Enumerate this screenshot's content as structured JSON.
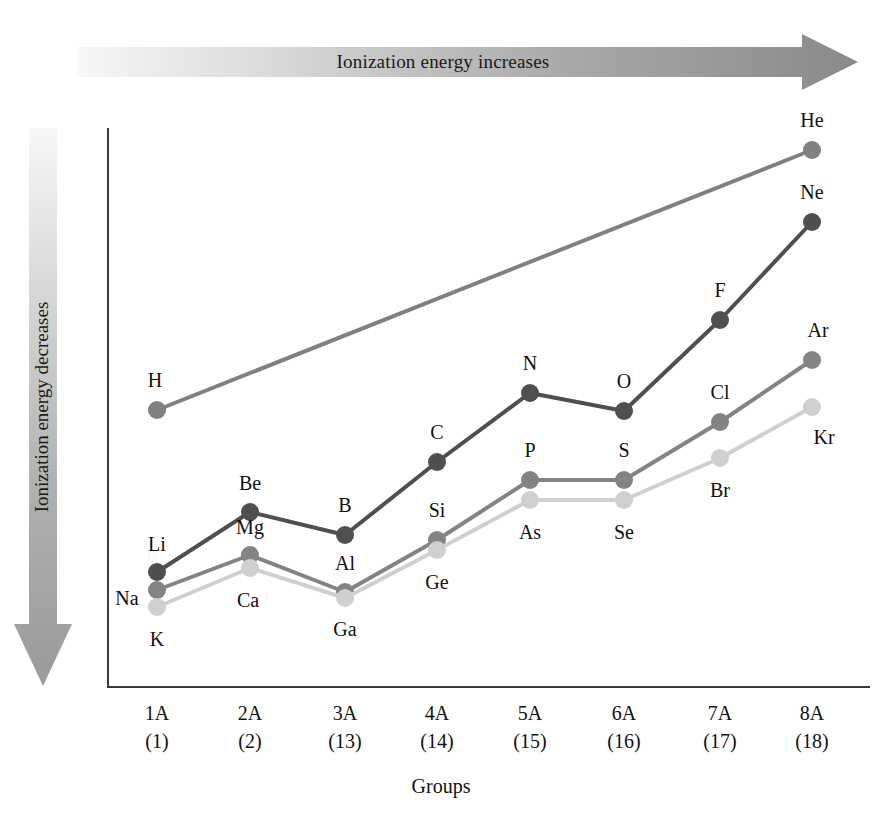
{
  "annotations": {
    "top_arrow": {
      "text": "Ionization energy increases",
      "direction": "right",
      "gradient_from": "#f2f2f2",
      "gradient_to": "#8d8d8d"
    },
    "left_arrow": {
      "text": "Ionization energy decreases",
      "direction": "down",
      "gradient_from": "#f2f2f2",
      "gradient_to": "#9a9a9a"
    }
  },
  "chart_data": {
    "type": "line",
    "title": "",
    "xlabel": "Groups",
    "ylabel": "",
    "grid": false,
    "legend": "none",
    "categories": [
      "1A",
      "2A",
      "3A",
      "4A",
      "5A",
      "6A",
      "7A",
      "8A"
    ],
    "category_numbers": [
      "(1)",
      "(2)",
      "(13)",
      "(14)",
      "(15)",
      "(16)",
      "(17)",
      "(18)"
    ],
    "x_ticks": [
      {
        "group": "1A",
        "number": "(1)"
      },
      {
        "group": "2A",
        "number": "(2)"
      },
      {
        "group": "3A",
        "number": "(13)"
      },
      {
        "group": "4A",
        "number": "(14)"
      },
      {
        "group": "5A",
        "number": "(15)"
      },
      {
        "group": "6A",
        "number": "(16)"
      },
      {
        "group": "7A",
        "number": "(17)"
      },
      {
        "group": "8A",
        "number": "(18)"
      }
    ],
    "series": [
      {
        "name": "Period 1",
        "color": "#808080",
        "points": [
          {
            "label": "H",
            "group": "1A",
            "x": 50,
            "y": 282,
            "label_dx": -2,
            "label_dy": -30
          },
          {
            "label": "He",
            "group": "8A",
            "x": 705,
            "y": 22,
            "label_dx": 0,
            "label_dy": -30
          }
        ]
      },
      {
        "name": "Period 2",
        "color": "#4f4f4f",
        "points": [
          {
            "label": "Li",
            "group": "1A",
            "x": 50,
            "y": 444,
            "label_dx": 0,
            "label_dy": -28
          },
          {
            "label": "Be",
            "group": "2A",
            "x": 143,
            "y": 384,
            "label_dx": 0,
            "label_dy": -29
          },
          {
            "label": "B",
            "group": "3A",
            "x": 238,
            "y": 407,
            "label_dx": 0,
            "label_dy": -30
          },
          {
            "label": "C",
            "group": "4A",
            "x": 330,
            "y": 334,
            "label_dx": 0,
            "label_dy": -30
          },
          {
            "label": "N",
            "group": "5A",
            "x": 423,
            "y": 265,
            "label_dx": 0,
            "label_dy": -30
          },
          {
            "label": "O",
            "group": "6A",
            "x": 517,
            "y": 283,
            "label_dx": 0,
            "label_dy": -30
          },
          {
            "label": "F",
            "group": "7A",
            "x": 613,
            "y": 192,
            "label_dx": 0,
            "label_dy": -30
          },
          {
            "label": "Ne",
            "group": "8A",
            "x": 705,
            "y": 94,
            "label_dx": 0,
            "label_dy": -30
          }
        ]
      },
      {
        "name": "Period 3",
        "color": "#838383",
        "points": [
          {
            "label": "Na",
            "group": "1A",
            "x": 50,
            "y": 462,
            "label_dx": -30,
            "label_dy": 8
          },
          {
            "label": "Mg",
            "group": "2A",
            "x": 143,
            "y": 427,
            "label_dx": 0,
            "label_dy": -28
          },
          {
            "label": "Al",
            "group": "3A",
            "x": 238,
            "y": 464,
            "label_dx": 0,
            "label_dy": -29
          },
          {
            "label": "Si",
            "group": "4A",
            "x": 330,
            "y": 412,
            "label_dx": 0,
            "label_dy": -30
          },
          {
            "label": "P",
            "group": "5A",
            "x": 423,
            "y": 352,
            "label_dx": 0,
            "label_dy": -30
          },
          {
            "label": "S",
            "group": "6A",
            "x": 517,
            "y": 352,
            "label_dx": 0,
            "label_dy": -30
          },
          {
            "label": "Cl",
            "group": "7A",
            "x": 613,
            "y": 294,
            "label_dx": 0,
            "label_dy": -30
          },
          {
            "label": "Ar",
            "group": "8A",
            "x": 705,
            "y": 232,
            "label_dx": 6,
            "label_dy": -30
          }
        ]
      },
      {
        "name": "Period 4",
        "color": "#cfcfcf",
        "points": [
          {
            "label": "K",
            "group": "1A",
            "x": 50,
            "y": 479,
            "label_dx": 0,
            "label_dy": 32
          },
          {
            "label": "Ca",
            "group": "2A",
            "x": 143,
            "y": 440,
            "label_dx": -2,
            "label_dy": 32
          },
          {
            "label": "Ga",
            "group": "3A",
            "x": 238,
            "y": 470,
            "label_dx": 0,
            "label_dy": 31
          },
          {
            "label": "Ge",
            "group": "4A",
            "x": 330,
            "y": 422,
            "label_dx": 0,
            "label_dy": 32
          },
          {
            "label": "As",
            "group": "5A",
            "x": 423,
            "y": 372,
            "label_dx": 0,
            "label_dy": 32
          },
          {
            "label": "Se",
            "group": "6A",
            "x": 517,
            "y": 372,
            "label_dx": 0,
            "label_dy": 32
          },
          {
            "label": "Br",
            "group": "7A",
            "x": 613,
            "y": 330,
            "label_dx": 0,
            "label_dy": 32
          },
          {
            "label": "Kr",
            "group": "8A",
            "x": 705,
            "y": 279,
            "label_dx": 12,
            "label_dy": 30
          }
        ]
      }
    ]
  }
}
